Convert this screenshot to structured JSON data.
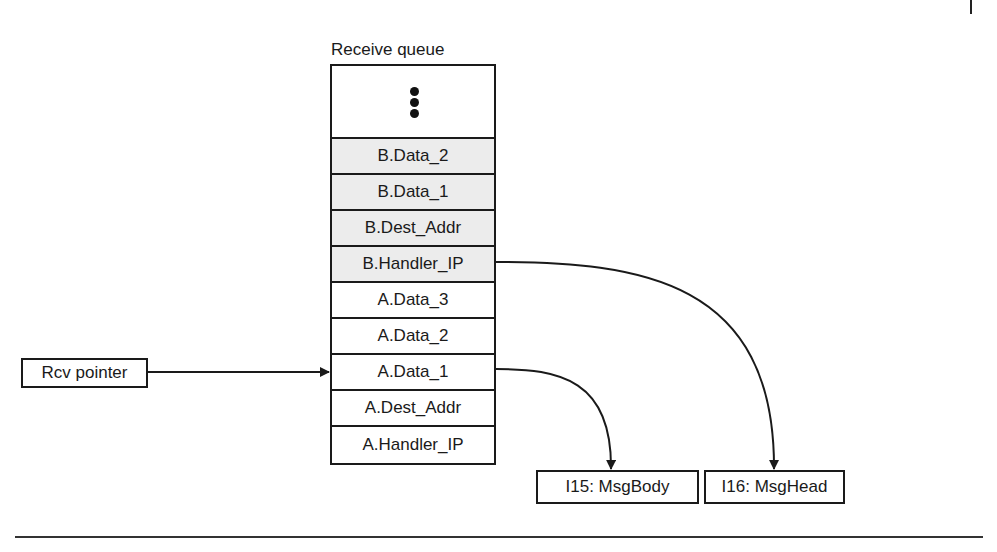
{
  "queue": {
    "title": "Receive queue",
    "ellipsis": "⋮",
    "rows": [
      {
        "label": "B.Data_2",
        "shaded": true
      },
      {
        "label": "B.Data_1",
        "shaded": true
      },
      {
        "label": "B.Dest_Addr",
        "shaded": true
      },
      {
        "label": "B.Handler_IP",
        "shaded": true
      },
      {
        "label": "A.Data_3",
        "shaded": false
      },
      {
        "label": "A.Data_2",
        "shaded": false
      },
      {
        "label": "A.Data_1",
        "shaded": false
      },
      {
        "label": "A.Dest_Addr",
        "shaded": false
      },
      {
        "label": "A.Handler_IP",
        "shaded": false
      }
    ]
  },
  "pointer": {
    "label": "Rcv pointer",
    "target": "A.Data_1"
  },
  "targets": [
    {
      "label": "I15: MsgBody",
      "source": "A.Data_1"
    },
    {
      "label": "I16: MsgHead",
      "source": "B.Handler_IP"
    }
  ],
  "colors": {
    "line": "#1a1a1a",
    "shaded_fill": "#ececec"
  }
}
